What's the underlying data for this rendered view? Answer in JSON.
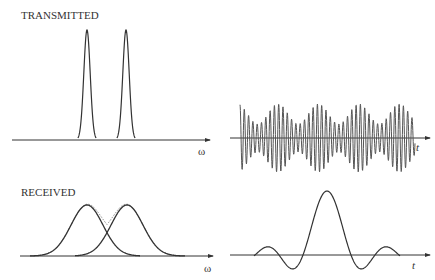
{
  "panels": {
    "transmitted": {
      "label": "TRANSMITTED",
      "spectrum_axis_label": "ω",
      "time_axis_label": "t",
      "description": "Two narrow spectral peaks; time signal is a beating carrier with 4 envelope humps"
    },
    "received": {
      "label": "RECEIVED",
      "spectrum_axis_label": "ω",
      "time_axis_label": "t",
      "description": "Two broadened overlapping Gaussians with dotted sum; time signal is a single sinc-like pulse"
    }
  },
  "colors": {
    "line": "#333333",
    "dotted": "#888888"
  }
}
